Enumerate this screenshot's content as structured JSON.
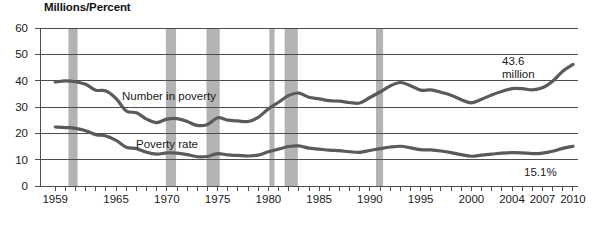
{
  "chart_data": {
    "type": "line",
    "title": "Millions/Percent",
    "xlabel": "",
    "ylabel": "Millions/Percent",
    "ylim": [
      0,
      60
    ],
    "xlim": [
      1957.5,
      2010.5
    ],
    "grid": true,
    "legend": "inline-labels",
    "ytick_labels": [
      "0",
      "10",
      "20",
      "30",
      "40",
      "50",
      "60"
    ],
    "ytick_values": [
      0,
      10,
      20,
      30,
      40,
      50,
      60
    ],
    "xtick_labels": [
      "1959",
      "1965",
      "1970",
      "1975",
      "1980",
      "1985",
      "1990",
      "1995",
      "2000",
      "2004",
      "2007",
      "2010"
    ],
    "xtick_values": [
      1959,
      1965,
      1970,
      1975,
      1980,
      1985,
      1990,
      1995,
      2000,
      2004,
      2007,
      2010
    ],
    "x": [
      1959,
      1960,
      1961,
      1962,
      1963,
      1964,
      1965,
      1966,
      1967,
      1968,
      1969,
      1970,
      1971,
      1972,
      1973,
      1974,
      1975,
      1976,
      1977,
      1978,
      1979,
      1980,
      1981,
      1982,
      1983,
      1984,
      1985,
      1986,
      1987,
      1988,
      1989,
      1990,
      1991,
      1992,
      1993,
      1994,
      1995,
      1996,
      1997,
      1998,
      1999,
      2000,
      2001,
      2002,
      2003,
      2004,
      2005,
      2006,
      2007,
      2008,
      2009,
      2010
    ],
    "series": [
      {
        "name": "Number in poverty",
        "unit": "millions",
        "color": "#5a5a5a",
        "values": [
          39.5,
          39.9,
          39.6,
          38.6,
          36.4,
          36.1,
          33.2,
          28.5,
          27.8,
          25.4,
          24.1,
          25.4,
          25.6,
          24.5,
          23.0,
          23.4,
          25.9,
          25.0,
          24.7,
          24.5,
          26.1,
          29.3,
          31.8,
          34.4,
          35.3,
          33.7,
          33.1,
          32.4,
          32.2,
          31.7,
          31.5,
          33.6,
          35.7,
          38.0,
          39.3,
          38.1,
          36.4,
          36.5,
          35.6,
          34.5,
          32.8,
          31.6,
          32.9,
          34.6,
          35.9,
          37.0,
          37.0,
          36.5,
          37.3,
          39.8,
          43.6,
          46.2
        ],
        "end_label": "43.6 million"
      },
      {
        "name": "Poverty rate",
        "unit": "percent",
        "color": "#5a5a5a",
        "values": [
          22.4,
          22.2,
          21.9,
          21.0,
          19.5,
          19.0,
          17.3,
          14.7,
          14.2,
          12.8,
          12.1,
          12.6,
          12.5,
          11.9,
          11.1,
          11.2,
          12.3,
          11.8,
          11.6,
          11.4,
          11.7,
          13.0,
          14.0,
          15.0,
          15.2,
          14.4,
          14.0,
          13.6,
          13.4,
          13.0,
          12.8,
          13.5,
          14.2,
          14.8,
          15.1,
          14.5,
          13.8,
          13.7,
          13.3,
          12.7,
          11.9,
          11.3,
          11.7,
          12.1,
          12.5,
          12.7,
          12.6,
          12.3,
          12.5,
          13.2,
          14.3,
          15.1
        ],
        "end_label": "15.1%"
      }
    ],
    "annotations": [
      {
        "name": "number-in-poverty-end-value",
        "text_line1": "43.6",
        "text_line2": "million"
      },
      {
        "name": "poverty-rate-end-value",
        "text": "15.1%"
      }
    ],
    "recession_bands": [
      {
        "start": 1960.3,
        "end": 1961.2
      },
      {
        "start": 1969.9,
        "end": 1970.9
      },
      {
        "start": 1973.9,
        "end": 1975.2
      },
      {
        "start": 1980.1,
        "end": 1980.6
      },
      {
        "start": 1981.6,
        "end": 1982.9
      },
      {
        "start": 1990.6,
        "end": 1991.3
      }
    ],
    "recession_band_color": "#b3b3b3"
  }
}
